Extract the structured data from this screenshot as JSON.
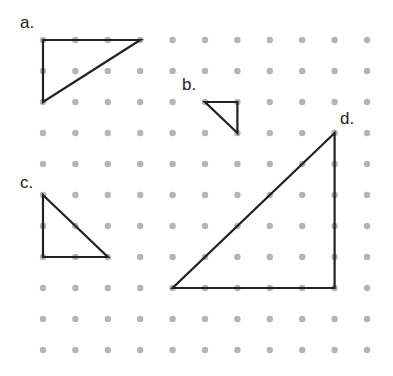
{
  "grid": {
    "cols": 11,
    "rows": 11,
    "x0": 43,
    "y0": 40,
    "dx": 32.4,
    "dy": 31,
    "dot_color": "#b5b5b5",
    "dot_radius": 3.2
  },
  "line_color": "#222222",
  "triangles": [
    {
      "label": "a.",
      "points": [
        [
          0,
          0
        ],
        [
          3,
          0
        ],
        [
          0,
          2
        ]
      ],
      "label_pos": [
        20,
        28
      ]
    },
    {
      "label": "b.",
      "points": [
        [
          5,
          2
        ],
        [
          6,
          2
        ],
        [
          6,
          3
        ]
      ],
      "label_pos": [
        182,
        90
      ]
    },
    {
      "label": "c.",
      "points": [
        [
          0,
          5
        ],
        [
          0,
          7
        ],
        [
          2,
          7
        ]
      ],
      "label_pos": [
        20,
        188
      ]
    },
    {
      "label": "d.",
      "points": [
        [
          9,
          3
        ],
        [
          9,
          8
        ],
        [
          4,
          8
        ]
      ],
      "label_pos": [
        340,
        124
      ]
    }
  ]
}
